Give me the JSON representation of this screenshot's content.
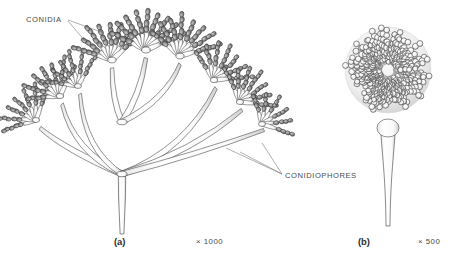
{
  "figure": {
    "kind": "scientific-illustration",
    "background_color": "#ffffff",
    "ink_color": "#3a3a3a"
  },
  "annotations": [
    {
      "id": "conidia",
      "label": "CONIDIA",
      "x": 26,
      "y": 22,
      "leaders": [
        {
          "x1": 68,
          "y1": 20,
          "x2": 104,
          "y2": 33
        },
        {
          "x1": 68,
          "y1": 21,
          "x2": 90,
          "y2": 47
        }
      ]
    },
    {
      "id": "conidiophores",
      "label": "CONIDIOPHORES",
      "x": 285,
      "y": 178,
      "leaders": [
        {
          "x1": 282,
          "y1": 174,
          "x2": 226,
          "y2": 148
        },
        {
          "x1": 282,
          "y1": 174,
          "x2": 240,
          "y2": 152
        },
        {
          "x1": 282,
          "y1": 174,
          "x2": 262,
          "y2": 143
        }
      ]
    }
  ],
  "panels": [
    {
      "id": "a",
      "caption": "(a)",
      "caption_x": 114,
      "caption_y": 245,
      "magnification": "× 1000",
      "mag_x": 196,
      "mag_y": 244,
      "type": "penicillium-like-branched-conidiophore",
      "conidia_fill": "#878787",
      "conidia_stroke": "#3c3c3c",
      "stalk_fill": "#fcfcfc",
      "stalk_stroke": "#4a4a4a",
      "stalk": {
        "x": 122,
        "base_y": 234,
        "top_y": 172,
        "half_width": 3.4
      },
      "branch_points": [
        {
          "x": 122,
          "y": 174
        },
        {
          "x": 122,
          "y": 122
        }
      ],
      "penicilli": [
        {
          "cx": 36,
          "cy": 120,
          "scale": 0.82,
          "spread": 128,
          "rot": -44,
          "phialides": 7,
          "chain": 4,
          "tone": 0.95
        },
        {
          "cx": 60,
          "cy": 96,
          "scale": 0.86,
          "spread": 120,
          "rot": -34,
          "phialides": 7,
          "chain": 4,
          "tone": 1.0
        },
        {
          "cx": 78,
          "cy": 86,
          "scale": 0.8,
          "spread": 112,
          "rot": -26,
          "phialides": 6,
          "chain": 4,
          "tone": 0.92
        },
        {
          "cx": 112,
          "cy": 60,
          "scale": 0.95,
          "spread": 120,
          "rot": -12,
          "phialides": 8,
          "chain": 4,
          "tone": 1.05
        },
        {
          "cx": 146,
          "cy": 50,
          "scale": 1.0,
          "spread": 130,
          "rot": 2,
          "phialides": 9,
          "chain": 4,
          "tone": 1.1
        },
        {
          "cx": 180,
          "cy": 56,
          "scale": 0.95,
          "spread": 124,
          "rot": 12,
          "phialides": 8,
          "chain": 4,
          "tone": 1.05
        },
        {
          "cx": 214,
          "cy": 80,
          "scale": 0.88,
          "spread": 118,
          "rot": 26,
          "phialides": 7,
          "chain": 4,
          "tone": 0.98
        },
        {
          "cx": 240,
          "cy": 102,
          "scale": 0.84,
          "spread": 120,
          "rot": 36,
          "phialides": 7,
          "chain": 4,
          "tone": 0.95
        },
        {
          "cx": 262,
          "cy": 124,
          "scale": 0.8,
          "spread": 124,
          "rot": 46,
          "phialides": 6,
          "chain": 4,
          "tone": 0.92
        }
      ],
      "branches": [
        {
          "x1": 122,
          "y1": 174,
          "x2": 66,
          "y2": 150,
          "x3": 40,
          "y3": 128,
          "w": 3.0
        },
        {
          "x1": 122,
          "y1": 174,
          "x2": 74,
          "y2": 152,
          "x3": 62,
          "y3": 104,
          "w": 2.8
        },
        {
          "x1": 122,
          "y1": 174,
          "x2": 84,
          "y2": 150,
          "x3": 80,
          "y3": 94,
          "w": 2.6
        },
        {
          "x1": 122,
          "y1": 174,
          "x2": 186,
          "y2": 150,
          "x3": 216,
          "y3": 88,
          "w": 3.0
        },
        {
          "x1": 122,
          "y1": 174,
          "x2": 192,
          "y2": 152,
          "x3": 242,
          "y3": 110,
          "w": 2.8
        },
        {
          "x1": 122,
          "y1": 174,
          "x2": 198,
          "y2": 154,
          "x3": 264,
          "y3": 130,
          "w": 2.6
        },
        {
          "x1": 122,
          "y1": 122,
          "x2": 112,
          "y2": 100,
          "x3": 112,
          "y3": 68,
          "w": 2.8
        },
        {
          "x1": 122,
          "y1": 122,
          "x2": 140,
          "y2": 96,
          "x3": 146,
          "y3": 58,
          "w": 3.0
        },
        {
          "x1": 122,
          "y1": 122,
          "x2": 166,
          "y2": 100,
          "x3": 180,
          "y3": 64,
          "w": 2.8
        }
      ]
    },
    {
      "id": "b",
      "caption": "(b)",
      "caption_x": 358,
      "caption_y": 245,
      "magnification": "× 500",
      "mag_x": 418,
      "mag_y": 244,
      "type": "aspergillus-radiate-conidial-head",
      "conidia_fill": "#fdfdfd",
      "conidia_stroke": "#404040",
      "head": {
        "cx": 388,
        "cy": 70,
        "rx": 58,
        "ry": 58,
        "rings": 5,
        "chain_length": 4
      },
      "vesicle": {
        "cx": 388,
        "cy": 128,
        "rx": 11,
        "ry": 9
      },
      "stalk": {
        "x": 388,
        "top_y": 128,
        "base_y": 226,
        "top_half_width": 7.5,
        "base_half_width": 2.0
      }
    }
  ]
}
